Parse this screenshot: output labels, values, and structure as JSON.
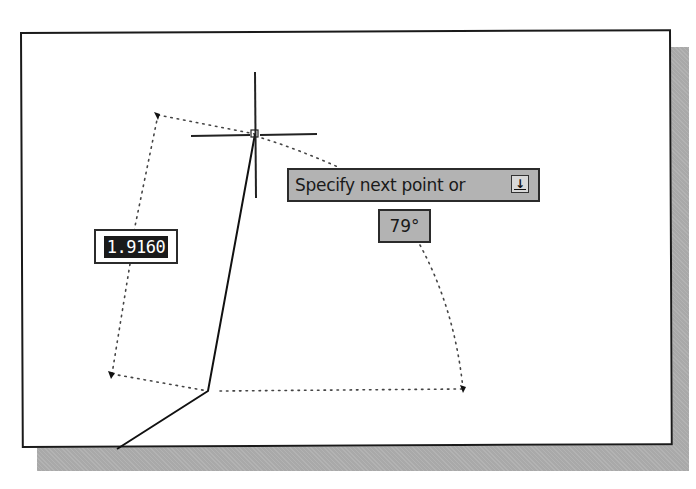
{
  "prompt": {
    "text": "Specify next point or",
    "dropdown_icon": "arrow-down-icon"
  },
  "dynamic_input": {
    "length_value": "1.9160",
    "angle_value": "79°"
  },
  "colors": {
    "tooltip_bg": "#b3b3b3",
    "input_bg": "#1a1a1a",
    "input_text": "#ffffff",
    "canvas_bg": "#ffffff",
    "shadow": "#a9a9a9"
  },
  "drawing": {
    "crosshair": {
      "x": 255,
      "y": 134
    },
    "polyline": [
      [
        117,
        449
      ],
      [
        208,
        391
      ],
      [
        255,
        134
      ]
    ],
    "tracking_points": [
      [
        158,
        115
      ],
      [
        112,
        374
      ],
      [
        463,
        389
      ]
    ]
  }
}
